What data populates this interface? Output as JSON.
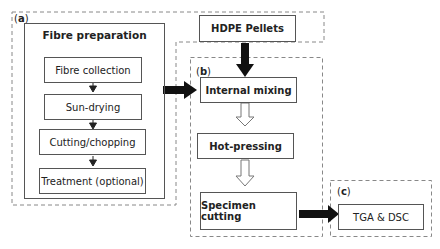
{
  "diagram": {
    "regions": {
      "a": {
        "label": "a"
      },
      "b": {
        "label": "b"
      },
      "c": {
        "label": "c"
      }
    },
    "fibre_preparation": {
      "title": "Fibre preparation",
      "steps": [
        "Fibre collection",
        "Sun-drying",
        "Cutting/chopping",
        "Treatment (optional)"
      ]
    },
    "hdpe": {
      "label": "HDPE Pellets"
    },
    "processing": {
      "steps": [
        "Internal mixing",
        "Hot-pressing",
        "Specimen cutting"
      ]
    },
    "analysis": {
      "label": "TGA & DSC"
    }
  }
}
